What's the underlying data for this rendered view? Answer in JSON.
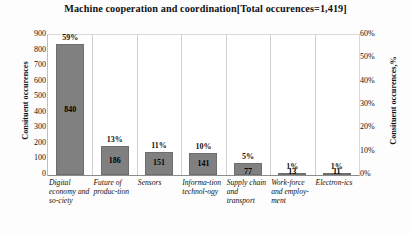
{
  "chart_data": {
    "type": "bar",
    "title": "Machine cooperation and coordination[Total occurences=1,419]",
    "categories": [
      "Digital economy and so-ciety",
      "Future of produc-tion",
      "Sensors",
      "Informa-tion technol-ogy",
      "Supply chain and transport",
      "Work-force and employ-ment",
      "Electron-ics"
    ],
    "values": [
      840,
      186,
      151,
      141,
      77,
      13,
      11
    ],
    "percent_labels": [
      "59%",
      "13%",
      "11%",
      "10%",
      "5%",
      "1%",
      "1%"
    ],
    "value_labels": [
      "840",
      "186",
      "151",
      "141",
      "77",
      "13",
      "11"
    ],
    "xlabel": "",
    "ylabel": "Consituent occurences",
    "ylabel_right": "Consituent occurences,%",
    "ylim": [
      0,
      900
    ],
    "ylim_right": [
      0,
      60
    ],
    "yticks": [
      "900",
      "800",
      "700",
      "600",
      "500",
      "400",
      "300",
      "200",
      "100",
      "0"
    ],
    "yticks_right": [
      "60%",
      "50%",
      "40%",
      "30%",
      "20%",
      "10%",
      "0%"
    ],
    "grid": "vertical",
    "legend": "none",
    "bar_color": "#808080",
    "total_occurences": "1,419"
  }
}
